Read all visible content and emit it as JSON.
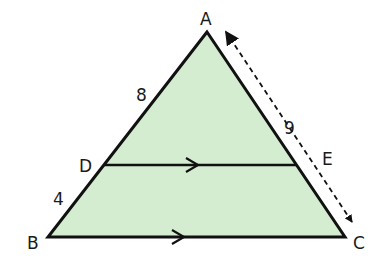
{
  "figure": {
    "fill_color": "#d4ecd0",
    "stroke_color": "#111111",
    "vertices": {
      "A": {
        "label": "A",
        "x": 207,
        "y": 32
      },
      "B": {
        "label": "B",
        "x": 48,
        "y": 237
      },
      "C": {
        "label": "C",
        "x": 345,
        "y": 237
      },
      "D": {
        "label": "D",
        "x": 104,
        "y": 165
      },
      "E": {
        "label": "E",
        "x": 296,
        "y": 165
      }
    },
    "measurements": {
      "AD": "8",
      "DB": "4",
      "AE": "9"
    },
    "parallel_marks": [
      "DE",
      "BC"
    ],
    "dashed_measure": "AC"
  }
}
